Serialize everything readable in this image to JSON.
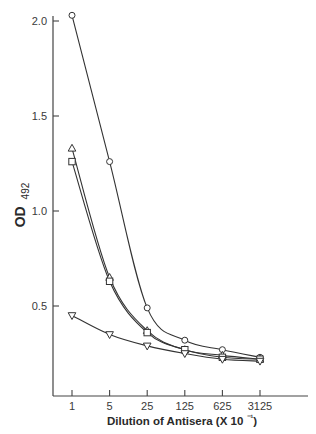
{
  "chart_data": {
    "type": "line",
    "title": "",
    "xlabel": "Dilution of Antisera (X 10⁻¹)",
    "ylabel_main": "OD",
    "ylabel_sub": "492",
    "ylabel": "OD 492",
    "x": [
      1,
      5,
      25,
      125,
      625,
      3125
    ],
    "x_tick_labels": [
      "1",
      "5",
      "25",
      "125",
      "625",
      "3125"
    ],
    "x_scale": "log5",
    "y_ticks": [
      0.5,
      1.0,
      1.5,
      2.0
    ],
    "y_tick_labels": [
      "0.5",
      "1.0",
      "1.5",
      "2.0"
    ],
    "ylim": [
      0.03,
      2.0
    ],
    "grid": false,
    "legend": "none",
    "series": [
      {
        "name": "circle",
        "marker": "circle",
        "values": [
          2.03,
          1.26,
          0.49,
          0.32,
          0.27,
          0.23
        ]
      },
      {
        "name": "triangle",
        "marker": "triangle-up",
        "values": [
          1.33,
          0.65,
          0.37,
          0.27,
          0.24,
          0.22
        ]
      },
      {
        "name": "square",
        "marker": "square",
        "values": [
          1.26,
          0.63,
          0.36,
          0.27,
          0.23,
          0.22
        ]
      },
      {
        "name": "inverted-triangle",
        "marker": "triangle-down",
        "values": [
          0.45,
          0.35,
          0.29,
          0.25,
          0.22,
          0.21
        ]
      }
    ]
  }
}
